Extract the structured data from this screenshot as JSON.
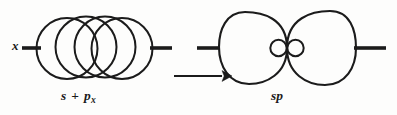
{
  "figure": {
    "kind": "chemistry-orbital-hybridization-diagram",
    "axis_label": "x",
    "reaction_arrow": "→",
    "left_label": {
      "full": "s + px",
      "first_orbital": "s",
      "operator": "+",
      "second_orbital": "p",
      "second_orbital_subscript": "x"
    },
    "right_label": {
      "full": "sp",
      "orbital": "sp"
    },
    "colors": {
      "ink": "#1a1a1a",
      "stroke": "#1b1b1b",
      "background": "#fdfdfc"
    },
    "geometry": {
      "width": 397,
      "height": 115,
      "centerline_y": 48,
      "left_diagram": {
        "bold_stub_left": [
          22,
          40
        ],
        "bold_stub_right": [
          152,
          172
        ],
        "circles": [
          {
            "cx": 67,
            "cy": 48,
            "r": 31
          },
          {
            "cx": 86,
            "cy": 47,
            "r": 31
          },
          {
            "cx": 105,
            "cy": 47,
            "r": 31
          },
          {
            "cx": 122,
            "cy": 48,
            "r": 31
          }
        ]
      },
      "right_diagram": {
        "bold_stub_left": [
          197,
          219
        ],
        "bold_stub_right": [
          355,
          385
        ],
        "lobes": 2,
        "junction_x": 287,
        "small_circles": [
          {
            "cx": 278,
            "cy": 48,
            "r": 8
          },
          {
            "cx": 295,
            "cy": 48,
            "r": 8
          }
        ]
      },
      "arrow": {
        "x1": 175,
        "x2": 228,
        "y": 76
      }
    }
  }
}
